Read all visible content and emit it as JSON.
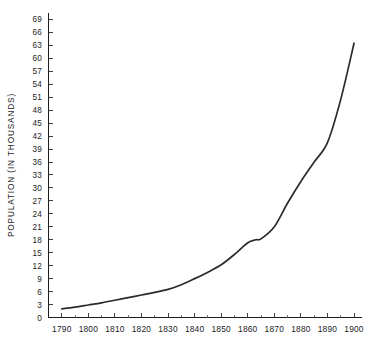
{
  "chart_data": {
    "type": "line",
    "title": "",
    "subtitle": "",
    "xlabel": "",
    "ylabel": "POPULATION (IN THOUSANDS)",
    "xlim": [
      1785,
      1903
    ],
    "ylim": [
      0,
      70.5
    ],
    "grid": false,
    "legend": null,
    "legend_position": "none",
    "x_major_ticks": [
      1790,
      1800,
      1810,
      1820,
      1830,
      1840,
      1850,
      1860,
      1870,
      1880,
      1890,
      1900
    ],
    "x_minor_ticks": [
      1795,
      1805,
      1815,
      1825,
      1835,
      1845,
      1855,
      1865,
      1875,
      1885,
      1895
    ],
    "x_tick_labels": [
      "1790",
      "1800",
      "1810",
      "1820",
      "1830",
      "1840",
      "1850",
      "1860",
      "1870",
      "1880",
      "1890",
      "1900"
    ],
    "y_major_ticks": [
      0,
      3,
      6,
      9,
      12,
      15,
      18,
      21,
      24,
      27,
      30,
      33,
      36,
      39,
      42,
      45,
      48,
      51,
      54,
      57,
      60,
      63,
      66,
      69
    ],
    "y_tick_labels": [
      "0",
      "3",
      "6",
      "9",
      "12",
      "15",
      "18",
      "21",
      "24",
      "27",
      "30",
      "33",
      "36",
      "39",
      "42",
      "45",
      "48",
      "51",
      "54",
      "57",
      "60",
      "63",
      "66",
      "69"
    ],
    "series": [
      {
        "name": "Population",
        "color": "#2b2b2b",
        "x": [
          1790,
          1795,
          1800,
          1805,
          1810,
          1815,
          1820,
          1825,
          1830,
          1835,
          1840,
          1845,
          1850,
          1855,
          1860,
          1863,
          1865,
          1870,
          1875,
          1880,
          1885,
          1890,
          1895,
          1900
        ],
        "values": [
          2.0,
          2.4,
          2.9,
          3.4,
          4.0,
          4.6,
          5.2,
          5.8,
          6.5,
          7.6,
          9.0,
          10.5,
          12.2,
          14.6,
          17.3,
          18.0,
          18.2,
          21.0,
          26.5,
          31.5,
          36.0,
          40.5,
          50.5,
          63.5
        ]
      }
    ]
  }
}
